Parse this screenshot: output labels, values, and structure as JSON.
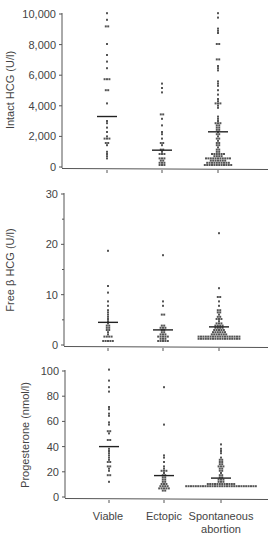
{
  "chart_data": [
    {
      "type": "scatter",
      "subtype": "dot-plot",
      "title": "",
      "ylabel": "Intact HCG (U/l)",
      "xlabel": "",
      "ylim": [
        0,
        10000
      ],
      "yticks": [
        0,
        2000,
        4000,
        6000,
        8000,
        10000
      ],
      "ytick_labels": [
        "0",
        "2,000",
        "4,000",
        "6,000",
        "8,000",
        "10,000"
      ],
      "categories": [
        "Viable",
        "Ectopic",
        "Spontaneous abortion"
      ],
      "means": [
        3300,
        1100,
        2300
      ],
      "series": [
        {
          "name": "Viable",
          "values": [
            10000,
            9600,
            9200,
            9200,
            8000,
            7300,
            6900,
            6400,
            5800,
            5800,
            5700,
            5000,
            5000,
            4200,
            3000,
            2800,
            2600,
            2300,
            2000,
            1900,
            1900,
            1800,
            1600,
            1500,
            1400,
            1000,
            900,
            700,
            500
          ]
        },
        {
          "name": "Ectopic",
          "values": [
            5500,
            5200,
            4900,
            3500,
            3400,
            3100,
            2700,
            2300,
            2200,
            1800,
            1600,
            1500,
            1400,
            1200,
            1100,
            1000,
            900,
            900,
            800,
            600,
            600,
            500,
            400,
            400,
            300,
            300,
            300,
            200,
            200,
            200
          ]
        },
        {
          "name": "Spontaneous abortion",
          "values": [
            10100,
            9700,
            9100,
            8900,
            8800,
            8000,
            8000,
            7000,
            7000,
            6600,
            6500,
            6300,
            5600,
            5500,
            5300,
            5000,
            4700,
            4500,
            4300,
            4200,
            4200,
            4100,
            4000,
            3900,
            3300,
            3200,
            3000,
            2900,
            2800,
            2800,
            2700,
            2700,
            2600,
            2600,
            2500,
            2400,
            2300,
            2200,
            2100,
            2000,
            1900,
            1800,
            1700,
            1600,
            1500,
            1400,
            1400,
            1300,
            1200,
            1100,
            1000,
            1000,
            900,
            900,
            900,
            800,
            800,
            800,
            700,
            700,
            700,
            700,
            600,
            600,
            600,
            600,
            600,
            500,
            500,
            500,
            500,
            500,
            500,
            400,
            400,
            400,
            400,
            400,
            400,
            400,
            300,
            300,
            300,
            300,
            300,
            300,
            300,
            300,
            300,
            300,
            200,
            200,
            200,
            200,
            200,
            200,
            200,
            200,
            200,
            200,
            200,
            200
          ]
        }
      ],
      "grid": false
    },
    {
      "type": "scatter",
      "subtype": "dot-plot",
      "title": "",
      "ylabel": "Free β HCG (U/l)",
      "xlabel": "",
      "ylim": [
        0,
        30
      ],
      "yticks": [
        0,
        10,
        20,
        30
      ],
      "ytick_labels": [
        "0",
        "10",
        "20",
        "30"
      ],
      "categories": [
        "Viable",
        "Ectopic",
        "Spontaneous abortion"
      ],
      "means": [
        4.5,
        3.0,
        3.6
      ],
      "series": [
        {
          "name": "Viable",
          "values": [
            18.8,
            11.8,
            10.2,
            8.5,
            7.8,
            7.0,
            6.5,
            6.0,
            5.5,
            5.0,
            4.8,
            4.3,
            4.0,
            3.8,
            3.5,
            3.2,
            3.0,
            2.8,
            2.5,
            2.0,
            1.8,
            1.8,
            1.5,
            1.5,
            1.0,
            1.0,
            0.8,
            0.8,
            0.6
          ]
        },
        {
          "name": "Ectopic",
          "values": [
            17.7,
            8.5,
            7.6,
            6.0,
            6.0,
            4.0,
            4.0,
            3.6,
            3.5,
            3.2,
            3.0,
            2.8,
            2.5,
            2.5,
            2.2,
            2.0,
            2.0,
            1.8,
            1.8,
            1.5,
            1.5,
            1.5,
            1.3,
            1.3,
            1.2,
            1.0,
            1.0,
            1.0,
            0.9,
            0.9
          ]
        },
        {
          "name": "Spontaneous abortion",
          "values": [
            22.2,
            11.5,
            9.5,
            9.5,
            8.5,
            8.0,
            7.0,
            7.0,
            6.5,
            6.3,
            6.0,
            5.8,
            5.5,
            5.3,
            5.0,
            5.0,
            4.8,
            4.5,
            4.5,
            4.3,
            4.0,
            4.0,
            3.8,
            3.8,
            3.5,
            3.5,
            3.3,
            3.3,
            3.0,
            3.0,
            3.0,
            2.8,
            2.8,
            2.6,
            2.6,
            2.6,
            2.4,
            2.4,
            2.4,
            2.2,
            2.2,
            2.2,
            2.0,
            2.0,
            2.0,
            2.0,
            1.8,
            1.8,
            1.8,
            1.8,
            1.8,
            1.6,
            1.6,
            1.6,
            1.6,
            1.6,
            1.6,
            1.5,
            1.5,
            1.5,
            1.5,
            1.5,
            1.5,
            1.5,
            1.4,
            1.4,
            1.4,
            1.4,
            1.4,
            1.4,
            1.4,
            1.4,
            1.3,
            1.3,
            1.3,
            1.3,
            1.3,
            1.3,
            1.3,
            1.3,
            1.3,
            1.3
          ]
        }
      ],
      "grid": false
    },
    {
      "type": "scatter",
      "subtype": "dot-plot",
      "title": "",
      "ylabel": "Progesterone (nmol/l)",
      "xlabel": "",
      "ylim": [
        0,
        100
      ],
      "yticks": [
        0,
        20,
        40,
        60,
        80,
        100
      ],
      "ytick_labels": [
        "0",
        "20",
        "40",
        "60",
        "80",
        "100"
      ],
      "categories": [
        "Viable",
        "Ectopic",
        "Spontaneous abortion"
      ],
      "means": [
        40,
        17,
        15
      ],
      "series": [
        {
          "name": "Viable",
          "values": [
            101,
            93,
            88,
            84,
            72,
            70,
            67,
            65,
            60,
            57,
            53,
            52,
            51,
            46,
            45,
            38,
            37,
            35,
            33,
            31,
            29,
            28,
            27,
            25,
            24,
            22,
            20,
            17,
            17,
            12
          ]
        },
        {
          "name": "Ectopic",
          "values": [
            88,
            57,
            33,
            31,
            28,
            25,
            23,
            21,
            20,
            20,
            19,
            18,
            17,
            16,
            15,
            14,
            13,
            12,
            12,
            11,
            10,
            10,
            9,
            9,
            8,
            8,
            7,
            7,
            6,
            6,
            6,
            5,
            5
          ]
        },
        {
          "name": "Spontaneous abortion",
          "values": [
            42,
            38,
            36,
            34,
            32,
            30,
            29,
            28,
            27,
            26,
            26,
            25,
            25,
            24,
            23,
            22,
            21,
            20,
            19,
            18,
            17,
            16,
            15,
            14,
            13,
            13,
            12,
            12,
            12,
            11,
            11,
            11,
            11,
            10,
            10,
            10,
            10,
            10,
            10,
            10,
            10,
            9,
            9,
            9,
            9,
            9,
            9,
            9,
            9,
            9,
            9,
            9,
            9,
            8,
            8,
            8,
            8,
            8,
            8,
            8,
            8,
            8,
            8,
            8,
            8,
            8,
            8,
            8,
            8,
            8,
            8
          ]
        }
      ],
      "grid": false
    }
  ],
  "panels": {
    "p1": {
      "ylabel": "Intact HCG (U/l)"
    },
    "p2": {
      "ylabel": "Free β HCG (U/l)"
    },
    "p3": {
      "ylabel": "Progesterone (nmol/l)"
    }
  },
  "x_labels": {
    "viable": "Viable",
    "ectopic": "Ectopic",
    "spont_line1": "Spontaneous",
    "spont_line2": "abortion"
  }
}
